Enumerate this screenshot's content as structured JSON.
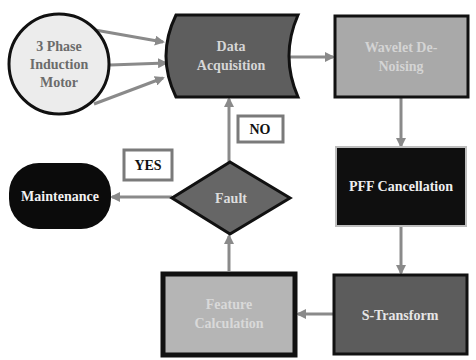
{
  "diagram": {
    "nodes": {
      "motor": {
        "label_lines": [
          "3 Phase",
          "Induction",
          "Motor"
        ],
        "shape": "circle",
        "fill": "#ececec",
        "text_color": "#6b6b6b",
        "stroke": "#111111"
      },
      "acquisition": {
        "label_lines": [
          "Data",
          "Acquisition"
        ],
        "shape": "stored-data",
        "fill": "#5e5e5e",
        "text_color": "#d6d6d6",
        "stroke": "#111111"
      },
      "wavelet": {
        "label_lines": [
          "Wavelet De-",
          "Noising"
        ],
        "shape": "rectangle",
        "fill": "#a9a9a9",
        "text_color": "#d4d4d4",
        "stroke": "#111111"
      },
      "pff": {
        "label_lines": [
          "PFF Cancellation"
        ],
        "shape": "rectangle",
        "fill": "#0f0f0f",
        "text_color": "#eeeeee",
        "stroke": "#bdbdbd"
      },
      "stransform": {
        "label_lines": [
          "S-Transform"
        ],
        "shape": "rectangle",
        "fill": "#5c5c5c",
        "text_color": "#e6e6e6",
        "stroke": "#111111"
      },
      "feature": {
        "label_lines": [
          "Feature",
          "Calculation"
        ],
        "shape": "rectangle",
        "fill": "#b5b5b5",
        "text_color": "#d9d9d9",
        "stroke": "#111111"
      },
      "fault": {
        "label_lines": [
          "Fault"
        ],
        "shape": "diamond",
        "fill": "#666666",
        "text_color": "#dddddd",
        "stroke": "#111111"
      },
      "maintenance": {
        "label_lines": [
          "Maintenance"
        ],
        "shape": "terminator",
        "fill": "#0b0b0b",
        "text_color": "#f2f2f2",
        "stroke": "#0b0b0b"
      }
    },
    "decision_labels": {
      "no": "NO",
      "yes": "YES"
    },
    "colors": {
      "arrow": "#8a8a8a",
      "label_box_border": "#7a7a7a",
      "label_text": "#111111"
    },
    "edges": [
      {
        "from": "motor",
        "to": "acquisition",
        "count": 3
      },
      {
        "from": "acquisition",
        "to": "wavelet"
      },
      {
        "from": "wavelet",
        "to": "pff"
      },
      {
        "from": "pff",
        "to": "stransform"
      },
      {
        "from": "stransform",
        "to": "feature"
      },
      {
        "from": "feature",
        "to": "fault"
      },
      {
        "from": "fault",
        "to": "acquisition",
        "label": "NO"
      },
      {
        "from": "fault",
        "to": "maintenance",
        "label": "YES"
      }
    ]
  }
}
